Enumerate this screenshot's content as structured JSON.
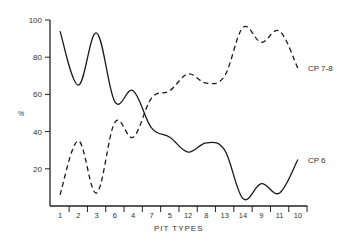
{
  "chart_data": {
    "type": "line",
    "title": "",
    "xlabel": "PIT TYPES",
    "ylabel": "%",
    "ylim": [
      0,
      100
    ],
    "yticks": [
      20,
      40,
      60,
      80,
      100
    ],
    "grid": false,
    "legend_position": "inline-right",
    "categories": [
      "1",
      "2",
      "3",
      "6",
      "4",
      "7",
      "5",
      "12",
      "8",
      "13",
      "14",
      "9",
      "11",
      "10"
    ],
    "series": [
      {
        "name": "CP 6",
        "style": "solid",
        "values": [
          94,
          65,
          93,
          56,
          62,
          42,
          37,
          29,
          34,
          30,
          4,
          12,
          7,
          25
        ]
      },
      {
        "name": "CP 7-8",
        "style": "dashed",
        "values": [
          6,
          35,
          7,
          45,
          37,
          58,
          62,
          71,
          66,
          70,
          96,
          88,
          94,
          74
        ]
      }
    ]
  },
  "colors": {
    "line": "#1a1a1a",
    "axis": "#222222",
    "text": "#333333"
  }
}
